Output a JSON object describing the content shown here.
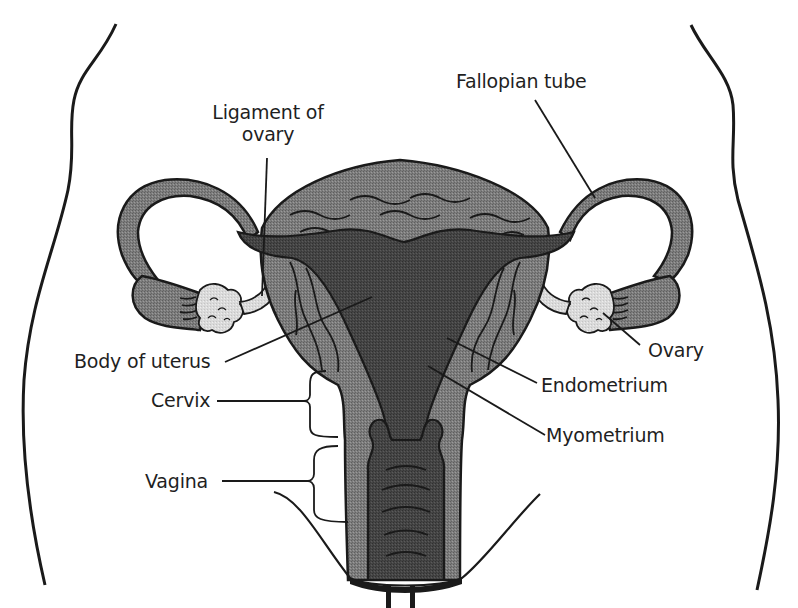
{
  "diagram": {
    "colors": {
      "background": "#ffffff",
      "outline": "#1a1a1a",
      "tissue_mid": "#7a7a7a",
      "tissue_dark": "#4a4a4a",
      "cavity": "#3c3c3c",
      "ovary_light": "#d8d8d8",
      "ligament_light": "#e2e2e2"
    },
    "labels": {
      "ligament_of_ovary_line1": "Ligament of",
      "ligament_of_ovary_line2": "ovary",
      "fallopian_tube": "Fallopian tube",
      "body_of_uterus": "Body of uterus",
      "cervix": "Cervix",
      "vagina": "Vagina",
      "ovary": "Ovary",
      "endometrium": "Endometrium",
      "myometrium": "Myometrium"
    },
    "nodes": [
      {
        "id": "fallopian-tube",
        "label": "Fallopian tube"
      },
      {
        "id": "ligament-of-ovary",
        "label": "Ligament of ovary"
      },
      {
        "id": "body-of-uterus",
        "label": "Body of uterus"
      },
      {
        "id": "cervix",
        "label": "Cervix"
      },
      {
        "id": "vagina",
        "label": "Vagina"
      },
      {
        "id": "ovary",
        "label": "Ovary"
      },
      {
        "id": "endometrium",
        "label": "Endometrium"
      },
      {
        "id": "myometrium",
        "label": "Myometrium"
      }
    ]
  }
}
